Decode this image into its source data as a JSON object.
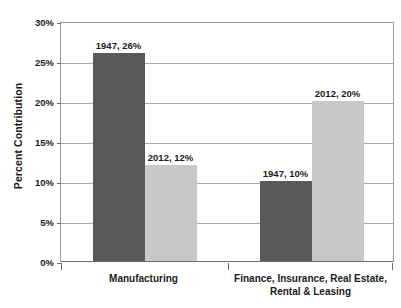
{
  "chart_data": {
    "type": "bar",
    "title": "",
    "subtitle": "",
    "xlabel": "",
    "ylabel": "Percent Contribution",
    "ylim": [
      0,
      30
    ],
    "ytick_step": 5,
    "ytick_labels": [
      "0%",
      "5%",
      "10%",
      "15%",
      "20%",
      "25%",
      "30%"
    ],
    "ytick_values": [
      0,
      5,
      10,
      15,
      20,
      25,
      30
    ],
    "grid": true,
    "legend": "none",
    "categories": [
      "Manufacturing",
      "Finance, Insurance, Real Estate, Rental & Leasing"
    ],
    "category_lines": [
      [
        "Manufacturing"
      ],
      [
        "Finance, Insurance, Real Estate,",
        "Rental & Leasing"
      ]
    ],
    "series": [
      {
        "name": "1947",
        "color": "#595959",
        "values": [
          26,
          10
        ]
      },
      {
        "name": "2012",
        "color": "#c8c8c8",
        "values": [
          12,
          20
        ]
      }
    ],
    "data_labels": [
      {
        "text": "1947, 26%",
        "category": 0,
        "series": 0,
        "value": 26
      },
      {
        "text": "2012, 12%",
        "category": 0,
        "series": 1,
        "value": 12
      },
      {
        "text": "1947, 10%",
        "category": 1,
        "series": 0,
        "value": 10
      },
      {
        "text": "2012, 20%",
        "category": 1,
        "series": 1,
        "value": 20
      }
    ],
    "value_suffix": "%"
  },
  "colors": {
    "series_1947": "#595959",
    "series_2012": "#c8c8c8",
    "gridline": "#a8a8a8",
    "axis": "#6b6b6b",
    "plot_border": "#9a9a9a",
    "text": "#1a1a1a",
    "background": "#ffffff"
  }
}
